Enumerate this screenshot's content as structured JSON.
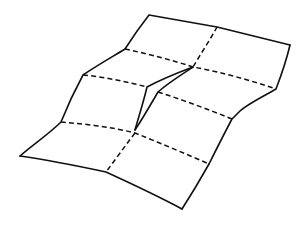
{
  "figure": {
    "colors": {
      "line": "#111111",
      "background": "#ffffff"
    },
    "grid": {
      "columns": 2,
      "rows": 4
    },
    "outline_points": [
      [
        149,
        15
      ],
      [
        217,
        27
      ],
      [
        290,
        45
      ],
      [
        276,
        89
      ],
      [
        232,
        119
      ],
      [
        209,
        164
      ],
      [
        182,
        209
      ],
      [
        106,
        172
      ],
      [
        20,
        156
      ],
      [
        61,
        122
      ],
      [
        83,
        75
      ],
      [
        125,
        49
      ]
    ],
    "fold_lines": {
      "horizontal": [
        [
          [
            125,
            49
          ],
          [
            193,
            67
          ],
          [
            276,
            89
          ]
        ],
        [
          [
            83,
            75
          ],
          [
            147,
            87
          ]
        ],
        [
          [
            158,
            92
          ],
          [
            232,
            119
          ]
        ],
        [
          [
            61,
            122
          ],
          [
            135,
            133
          ],
          [
            209,
            164
          ]
        ]
      ],
      "vertical": [
        [
          [
            217,
            27
          ],
          [
            193,
            67
          ]
        ],
        [
          [
            135,
            133
          ],
          [
            106,
            172
          ]
        ]
      ]
    },
    "crease": {
      "apex": [
        193,
        67
      ],
      "left_vertex": [
        147,
        87
      ],
      "right_vertex": [
        158,
        92
      ],
      "tip": [
        135,
        130
      ]
    }
  }
}
